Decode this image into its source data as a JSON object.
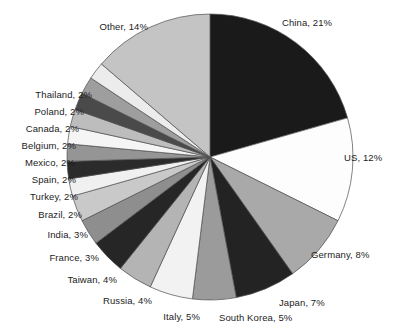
{
  "chart_data": {
    "type": "pie",
    "title": "",
    "subtitle": "",
    "xlabel": "",
    "ylabel": "",
    "legend_position": "none",
    "grid": false,
    "label_format": "{name}, {value}%",
    "start_angle_deg": 0,
    "direction": "clockwise",
    "units": "percent",
    "total": 100,
    "categories": [
      "China",
      "US",
      "Germany",
      "Japan",
      "South Korea",
      "Italy",
      "Russia",
      "Taiwan",
      "France",
      "India",
      "Brazil",
      "Turkey",
      "Spain",
      "Mexico",
      "Belgium",
      "Canada",
      "Poland",
      "Thailand",
      "Other"
    ],
    "values": [
      21,
      12,
      8,
      7,
      5,
      5,
      4,
      4,
      3,
      3,
      2,
      2,
      2,
      2,
      2,
      2,
      2,
      2,
      14
    ],
    "slices": [
      {
        "name": "China",
        "value": 21,
        "label": "China, 21%",
        "color": "#1a1a1a",
        "label_side": "right",
        "label_x": 282,
        "label_y": 17
      },
      {
        "name": "US",
        "value": 12,
        "label": "US, 12%",
        "color": "#fdfdfd",
        "label_side": "right",
        "label_x": 344,
        "label_y": 152
      },
      {
        "name": "Germany",
        "value": 8,
        "label": "Germany, 8%",
        "color": "#a9a9a9",
        "label_side": "right",
        "label_x": 311,
        "label_y": 249
      },
      {
        "name": "Japan",
        "value": 7,
        "label": "Japan, 7%",
        "color": "#232323",
        "label_side": "right",
        "label_x": 279,
        "label_y": 297
      },
      {
        "name": "South Korea",
        "value": 5,
        "label": "South Korea, 5%",
        "color": "#9b9b9b",
        "label_side": "right",
        "label_x": 219,
        "label_y": 312
      },
      {
        "name": "Italy",
        "value": 5,
        "label": "Italy, 5%",
        "color": "#f2f2f2",
        "label_side": "left",
        "label_x": 200,
        "label_y": 311
      },
      {
        "name": "Russia",
        "value": 4,
        "label": "Russia, 4%",
        "color": "#b4b4b4",
        "label_side": "left",
        "label_x": 152,
        "label_y": 295
      },
      {
        "name": "Taiwan",
        "value": 4,
        "label": "Taiwan, 4%",
        "color": "#262626",
        "label_side": "left",
        "label_x": 117,
        "label_y": 274
      },
      {
        "name": "France",
        "value": 3,
        "label": "France, 3%",
        "color": "#8e8e8e",
        "label_side": "left",
        "label_x": 99,
        "label_y": 252
      },
      {
        "name": "India",
        "value": 3,
        "label": "India, 3%",
        "color": "#c9c9c9",
        "label_side": "left",
        "label_x": 88,
        "label_y": 229
      },
      {
        "name": "Brazil",
        "value": 2,
        "label": "Brazil, 2%",
        "color": "#f0f0f0",
        "label_side": "left",
        "label_x": 82,
        "label_y": 209
      },
      {
        "name": "Turkey",
        "value": 2,
        "label": "Turkey, 2%",
        "color": "#2b2b2b",
        "label_side": "left",
        "label_x": 78,
        "label_y": 191
      },
      {
        "name": "Spain",
        "value": 2,
        "label": "Spain, 2%",
        "color": "#959595",
        "label_side": "left",
        "label_x": 76,
        "label_y": 174
      },
      {
        "name": "Mexico",
        "value": 2,
        "label": "Mexico, 2%",
        "color": "#f5f5f5",
        "label_side": "left",
        "label_x": 75,
        "label_y": 157
      },
      {
        "name": "Belgium",
        "value": 2,
        "label": "Belgium, 2%",
        "color": "#bdbdbd",
        "label_side": "left",
        "label_x": 76,
        "label_y": 140
      },
      {
        "name": "Canada",
        "value": 2,
        "label": "Canada, 2%",
        "color": "#4a4a4a",
        "label_side": "left",
        "label_x": 79,
        "label_y": 123
      },
      {
        "name": "Poland",
        "value": 2,
        "label": "Poland, 2%",
        "color": "#9e9e9e",
        "label_side": "left",
        "label_x": 84,
        "label_y": 106
      },
      {
        "name": "Thailand",
        "value": 2,
        "label": "Thailand, 2%",
        "color": "#ececec",
        "label_side": "left",
        "label_x": 92,
        "label_y": 89
      },
      {
        "name": "Other",
        "value": 14,
        "label": "Other, 14%",
        "color": "#c4c4c4",
        "label_side": "left",
        "label_x": 148,
        "label_y": 21
      }
    ],
    "geometry": {
      "cx": 210,
      "cy": 157,
      "r": 143
    },
    "style": {
      "background": "#ffffff",
      "stroke": "#4d4d4d",
      "stroke_width": 0.7,
      "label_color": "#1c1c1c"
    }
  }
}
